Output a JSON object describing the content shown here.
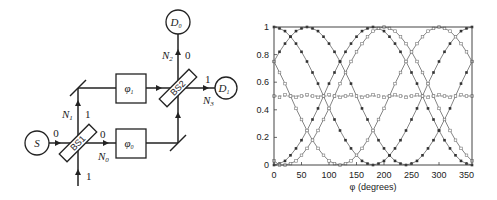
{
  "diagram": {
    "source_label": "S",
    "detector0_label": "D",
    "detector0_sub": "0",
    "detector1_label": "D",
    "detector1_sub": "1",
    "bs1_label": "BS1",
    "bs2_label": "BS2",
    "phase1_label": "φ",
    "phase1_sub": "1",
    "phase0_label": "φ",
    "phase0_sub": "0",
    "N0_label": "N",
    "N0_sub": "0",
    "N1_label": "N",
    "N1_sub": "1",
    "N2_label": "N",
    "N2_sub": "2",
    "N3_label": "N",
    "N3_sub": "3",
    "port_labels": {
      "bs1_in_left": "0",
      "bs1_in_bottom": "1",
      "bs1_out_up": "1",
      "bs1_out_right": "0",
      "bs2_out_up": "0",
      "bs2_out_right": "1"
    }
  },
  "chart_data": {
    "type": "line",
    "title": "",
    "xlabel": "φ (degrees)",
    "ylabel": "",
    "xlim": [
      0,
      360
    ],
    "ylim": [
      0,
      1
    ],
    "x_ticks": [
      "0",
      "50",
      "100",
      "150",
      "200",
      "250",
      "300",
      "350"
    ],
    "y_ticks": [
      "0",
      "0.2",
      "0.4",
      "0.6",
      "0.8",
      "1"
    ],
    "grid": false,
    "legend": "none",
    "x": [
      0,
      10,
      20,
      30,
      40,
      50,
      60,
      70,
      80,
      90,
      100,
      110,
      120,
      130,
      140,
      150,
      160,
      170,
      180,
      190,
      200,
      210,
      220,
      230,
      240,
      250,
      260,
      270,
      280,
      290,
      300,
      310,
      320,
      330,
      340,
      350,
      360
    ],
    "series": [
      {
        "name": "peak at 0°",
        "marker": "filled-square",
        "values": [
          1.0,
          0.99,
          0.97,
          0.93,
          0.88,
          0.82,
          0.75,
          0.67,
          0.59,
          0.5,
          0.41,
          0.33,
          0.25,
          0.18,
          0.12,
          0.07,
          0.03,
          0.01,
          0.0,
          0.01,
          0.03,
          0.07,
          0.12,
          0.18,
          0.25,
          0.33,
          0.41,
          0.5,
          0.59,
          0.67,
          0.75,
          0.82,
          0.88,
          0.93,
          0.97,
          0.99,
          1.0
        ]
      },
      {
        "name": "peak at 60°",
        "marker": "filled-square",
        "values": [
          0.75,
          0.82,
          0.88,
          0.93,
          0.97,
          0.99,
          1.0,
          0.99,
          0.97,
          0.93,
          0.88,
          0.82,
          0.75,
          0.67,
          0.59,
          0.5,
          0.41,
          0.33,
          0.25,
          0.18,
          0.12,
          0.07,
          0.03,
          0.01,
          0.0,
          0.01,
          0.03,
          0.07,
          0.12,
          0.18,
          0.25,
          0.33,
          0.41,
          0.5,
          0.59,
          0.67,
          0.75
        ]
      },
      {
        "name": "peak at 180°",
        "marker": "filled-square",
        "values": [
          0.0,
          0.01,
          0.03,
          0.07,
          0.12,
          0.18,
          0.25,
          0.33,
          0.41,
          0.5,
          0.59,
          0.67,
          0.75,
          0.82,
          0.88,
          0.93,
          0.97,
          0.99,
          1.0,
          0.99,
          0.97,
          0.93,
          0.88,
          0.82,
          0.75,
          0.67,
          0.59,
          0.5,
          0.41,
          0.33,
          0.25,
          0.18,
          0.12,
          0.07,
          0.03,
          0.01,
          0.0
        ]
      },
      {
        "name": "peak at 200°",
        "marker": "open-square",
        "values": [
          0.03,
          0.0,
          0.0,
          0.01,
          0.03,
          0.07,
          0.12,
          0.18,
          0.25,
          0.33,
          0.41,
          0.5,
          0.59,
          0.67,
          0.75,
          0.82,
          0.88,
          0.93,
          0.97,
          0.99,
          1.0,
          0.99,
          0.97,
          0.93,
          0.88,
          0.82,
          0.75,
          0.67,
          0.59,
          0.5,
          0.41,
          0.33,
          0.25,
          0.18,
          0.12,
          0.07,
          0.03
        ]
      },
      {
        "name": "peak at 300°",
        "marker": "open-square",
        "values": [
          0.75,
          0.67,
          0.59,
          0.5,
          0.41,
          0.33,
          0.25,
          0.18,
          0.12,
          0.07,
          0.03,
          0.01,
          0.0,
          0.01,
          0.03,
          0.07,
          0.12,
          0.18,
          0.25,
          0.33,
          0.41,
          0.5,
          0.59,
          0.67,
          0.75,
          0.82,
          0.88,
          0.93,
          0.97,
          0.99,
          1.0,
          0.99,
          0.97,
          0.93,
          0.88,
          0.82,
          0.75
        ]
      },
      {
        "name": "constant 0.5",
        "marker": "open-square",
        "dashed": true,
        "values": [
          0.5,
          0.49,
          0.51,
          0.5,
          0.49,
          0.5,
          0.51,
          0.5,
          0.49,
          0.5,
          0.51,
          0.5,
          0.49,
          0.5,
          0.51,
          0.5,
          0.49,
          0.5,
          0.51,
          0.5,
          0.49,
          0.5,
          0.51,
          0.5,
          0.49,
          0.5,
          0.51,
          0.5,
          0.49,
          0.5,
          0.51,
          0.5,
          0.49,
          0.5,
          0.51,
          0.5,
          0.5
        ]
      }
    ]
  }
}
